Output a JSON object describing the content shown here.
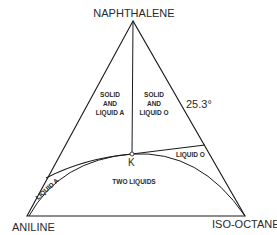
{
  "diagram": {
    "type": "ternary-phase-diagram",
    "vertices": {
      "top": "NAPHTHALENE",
      "bottom_left": "ANILINE",
      "bottom_right": "ISO-OCTANE"
    },
    "regions": {
      "solid_liquid_a": [
        "SOLID",
        "AND",
        "LIQUID A"
      ],
      "solid_liquid_o": [
        "SOLID",
        "AND",
        "LIQUID O"
      ],
      "two_liquids": "TWO LIQUIDS",
      "liquid_a": "LIQUID A",
      "liquid_o": "LIQUID O"
    },
    "point_label": "K",
    "temperature": "25.3°",
    "colors": {
      "line": "#1a1a1a",
      "background": "#ffffff"
    }
  }
}
